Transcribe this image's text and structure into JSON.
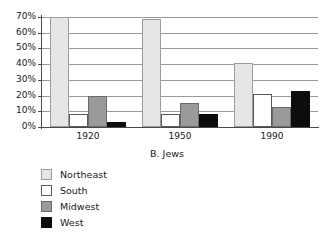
{
  "chart_data": {
    "type": "bar",
    "title": "B. Jews",
    "xlabel": "",
    "ylabel": "",
    "categories": [
      "1920",
      "1950",
      "1990"
    ],
    "series": [
      {
        "name": "Northeast",
        "color": "#e6e6e6",
        "values": [
          70,
          69,
          41
        ]
      },
      {
        "name": "South",
        "color": "#ffffff",
        "values": [
          8,
          8,
          21
        ]
      },
      {
        "name": "Midwest",
        "color": "#9a9a9a",
        "values": [
          20,
          15,
          13
        ]
      },
      {
        "name": "West",
        "color": "#0d0d0d",
        "values": [
          3,
          8,
          23
        ]
      }
    ],
    "ylim": [
      0,
      70
    ],
    "ytick_values": [
      0,
      10,
      20,
      30,
      40,
      50,
      60,
      70
    ],
    "ytick_labels": [
      "0%",
      "10%",
      "20%",
      "30%",
      "40%",
      "50%",
      "60%",
      "70%"
    ],
    "grid": true,
    "legend_position": "below-left",
    "value_suffix": "%"
  },
  "legend": {
    "items": [
      {
        "label": "Northeast",
        "swatch": "northeast"
      },
      {
        "label": "South",
        "swatch": "south"
      },
      {
        "label": "Midwest",
        "swatch": "midwest"
      },
      {
        "label": "West",
        "swatch": "west"
      }
    ]
  }
}
